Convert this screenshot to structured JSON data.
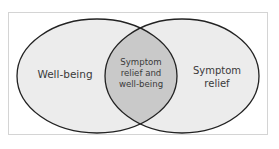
{
  "diagram": {
    "type": "venn",
    "colors": {
      "background": "#ffffff",
      "frame_border": "#d4d4d4",
      "set_fill": "#ececec",
      "overlap_fill": "#c9c9c9",
      "outline": "#222222",
      "text": "#3a3a3a"
    },
    "sets": [
      {
        "id": "left",
        "label": "Well-being"
      },
      {
        "id": "right",
        "label_line1": "Symptom",
        "label_line2": "relief"
      }
    ],
    "overlap": {
      "label_line1": "Symptom",
      "label_line2": "relief and",
      "label_line3": "well-being"
    }
  }
}
